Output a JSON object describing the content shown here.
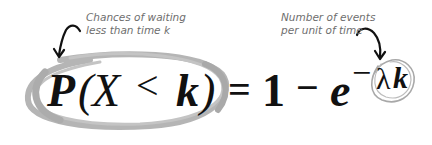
{
  "annotations": {
    "left": {
      "line1": "Chances of waiting",
      "line2": "less than time k"
    },
    "right": {
      "line1": "Number of events",
      "line2": "per unit of time"
    }
  },
  "formula": {
    "P": "P",
    "open_paren": "(",
    "X": "X",
    "less_than": "<",
    "k": "k",
    "close_paren": ")",
    "equals": "=",
    "one": "1",
    "minus": "−",
    "e": "e",
    "exp_minus": "−",
    "lambda": "λ",
    "exp_k": "k"
  },
  "colors": {
    "ink": "#111111",
    "annotation_text": "#6e6e6e",
    "circle_stroke": "#b0b0b0",
    "arrow": "#111111"
  }
}
